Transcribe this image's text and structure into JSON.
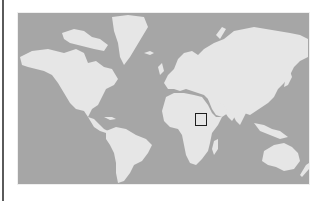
{
  "map": {
    "type": "world-map",
    "projection": "mercator",
    "colors": {
      "ocean": "#a6a6a6",
      "land": "#e6e6e6",
      "marker_border": "#1e1e1e",
      "left_rule": "#5a5a5a"
    },
    "marker": {
      "shape": "square",
      "region": "East Africa (Horn of Africa / Kenya-Somalia)",
      "left": 195,
      "top": 113,
      "size": 12
    }
  }
}
